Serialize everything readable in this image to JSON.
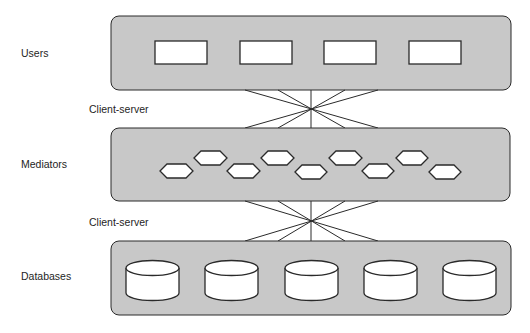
{
  "layers": [
    {
      "id": "users",
      "label": "Users",
      "item_count": 4,
      "item_shape": "rectangle"
    },
    {
      "id": "mediators",
      "label": "Mediators",
      "item_count": 9,
      "item_shape": "hexagon"
    },
    {
      "id": "databases",
      "label": "Databases",
      "item_count": 5,
      "item_shape": "cylinder"
    }
  ],
  "connectors": [
    {
      "label": "Client-server",
      "from": "users",
      "to": "mediators"
    },
    {
      "label": "Client-server",
      "from": "mediators",
      "to": "databases"
    }
  ],
  "colors": {
    "panel_fill": "#c8c8c8",
    "item_fill": "#ffffff",
    "stroke": "#2a2a2a"
  }
}
